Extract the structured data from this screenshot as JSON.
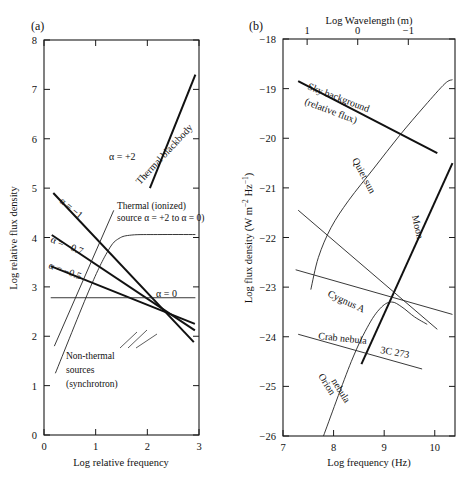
{
  "figure": {
    "panel_a_label": "(a)",
    "panel_b_label": "(b)"
  },
  "chart_data": [
    {
      "type": "line",
      "panel": "(a)",
      "title": "",
      "xlabel": "Log relative frequency",
      "ylabel": "Log relative flux density",
      "xlim": [
        0,
        3
      ],
      "ylim": [
        0,
        8
      ],
      "xticks": [
        "0",
        "1",
        "2",
        "3"
      ],
      "yticks": [
        "0",
        "1",
        "2",
        "3",
        "4",
        "5",
        "6",
        "7",
        "8"
      ],
      "grid": false,
      "legend_position": "inline-annotations",
      "annotations": [
        "α = +2",
        "Thermal blackbody",
        "Thermal (ionized) source α = +2 to α = 0)",
        "α = −1",
        "α = −0.7",
        "α = −0.5",
        "α = 0",
        "Non-thermal sources (synchrotron)"
      ],
      "series": [
        {
          "name": "Thermal blackbody (α = +2)",
          "label": "α = +2",
          "points": [
            [
              2.05,
              5.0
            ],
            [
              2.93,
              7.3
            ]
          ]
        },
        {
          "name": "Thermal ionized source turnover (α = +2 to α = 0)",
          "label": "Thermal (ionized) source α = +2 to α = 0)",
          "points": [
            [
              0.22,
              1.25
            ],
            [
              0.9,
              3.0
            ],
            [
              1.25,
              3.75
            ],
            [
              1.45,
              3.98
            ],
            [
              1.7,
              4.05
            ],
            [
              2.2,
              4.06
            ],
            [
              2.93,
              4.06
            ]
          ]
        },
        {
          "name": "Non-thermal α = −1",
          "label": "α = −1",
          "points": [
            [
              0.18,
              4.9
            ],
            [
              2.9,
              1.88
            ]
          ]
        },
        {
          "name": "Non-thermal α = −0.7",
          "label": "α = −0.7",
          "points": [
            [
              0.15,
              4.05
            ],
            [
              2.92,
              2.12
            ]
          ]
        },
        {
          "name": "Non-thermal α = −0.5",
          "label": "α = −0.5",
          "points": [
            [
              0.13,
              3.42
            ],
            [
              2.92,
              2.25
            ]
          ]
        },
        {
          "name": "Flat spectrum α = 0",
          "label": "α = 0",
          "points": [
            [
              0.13,
              2.78
            ],
            [
              2.93,
              2.78
            ]
          ]
        },
        {
          "name": "Steep rising line",
          "label": "",
          "points": [
            [
              0.2,
              1.8
            ],
            [
              1.35,
              4.55
            ]
          ]
        }
      ]
    },
    {
      "type": "line",
      "panel": "(b)",
      "title": "",
      "xlabel": "Log frequency (Hz)",
      "ylabel": "Log flux density (W m−2 Hz−1)",
      "ylabel_plain": "Log flux density (W m-2 Hz-1)",
      "top_xlabel": "Log Wavelength (m)",
      "xlim": [
        7,
        10.4
      ],
      "ylim": [
        -26,
        -18
      ],
      "xticks": [
        "7",
        "8",
        "9",
        "10"
      ],
      "yticks": [
        "−26",
        "−25",
        "−24",
        "−23",
        "−22",
        "−21",
        "−20",
        "−19",
        "−18"
      ],
      "top_xticks": [
        "1",
        "0",
        "−1",
        "−2"
      ],
      "grid": false,
      "legend_position": "inline-annotations",
      "annotations": [
        "Sky background (relative flux)",
        "Quiet sun",
        "Moon",
        "Cygnus A",
        "Crab nebula",
        "3C 273",
        "Orion nebula"
      ],
      "series": [
        {
          "name": "Sky background (relative flux)",
          "label": "Sky background (relative flux)",
          "points": [
            [
              7.3,
              -18.85
            ],
            [
              10.05,
              -20.3
            ]
          ]
        },
        {
          "name": "Quiet sun",
          "label": "Quiet sun",
          "points": [
            [
              7.55,
              -23.05
            ],
            [
              7.7,
              -22.4
            ],
            [
              7.95,
              -21.8
            ],
            [
              8.3,
              -21.25
            ],
            [
              8.8,
              -20.6
            ],
            [
              9.3,
              -19.95
            ],
            [
              9.8,
              -19.35
            ],
            [
              10.2,
              -18.9
            ],
            [
              10.35,
              -18.82
            ]
          ]
        },
        {
          "name": "Moon",
          "label": "Moon",
          "points": [
            [
              8.55,
              -24.55
            ],
            [
              10.35,
              -20.5
            ]
          ]
        },
        {
          "name": "Cygnus A",
          "label": "Cygnus A",
          "points": [
            [
              7.3,
              -21.45
            ],
            [
              10.05,
              -23.85
            ]
          ]
        },
        {
          "name": "Crab nebula",
          "label": "Crab nebula",
          "points": [
            [
              7.25,
              -22.65
            ],
            [
              10.35,
              -23.55
            ]
          ]
        },
        {
          "name": "3C 273",
          "label": "3C 273",
          "points": [
            [
              7.3,
              -23.95
            ],
            [
              9.75,
              -24.65
            ]
          ]
        },
        {
          "name": "Orion nebula",
          "label": "Orion nebula",
          "points": [
            [
              7.8,
              -26.0
            ],
            [
              8.35,
              -24.5
            ],
            [
              8.7,
              -23.75
            ],
            [
              8.95,
              -23.4
            ],
            [
              9.15,
              -23.3
            ],
            [
              9.35,
              -23.4
            ],
            [
              9.6,
              -23.6
            ],
            [
              9.85,
              -23.75
            ]
          ]
        }
      ]
    }
  ]
}
